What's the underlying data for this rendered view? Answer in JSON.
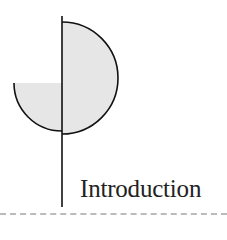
{
  "heading": {
    "title": "Introduction"
  },
  "colors": {
    "fill": "#e6e6e6",
    "stroke": "#111111",
    "rule": "#bbbbbb"
  }
}
